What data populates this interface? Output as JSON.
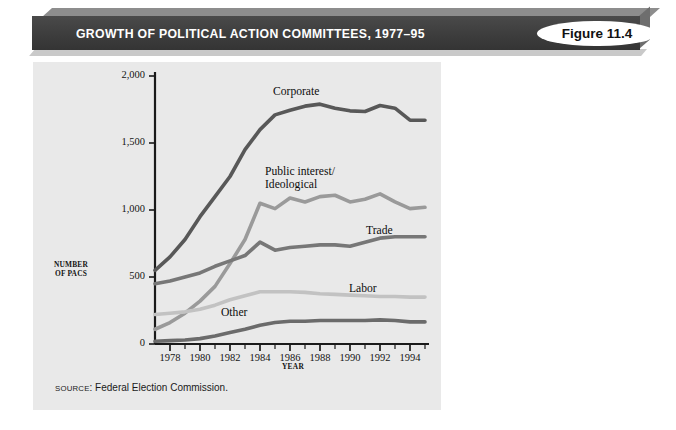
{
  "header": {
    "title": "GROWTH OF POLITICAL ACTION COMMITTEES, 1977–95",
    "badge": "Figure 11.4"
  },
  "source": {
    "prefix": "SOURCE",
    "text": ": Federal Election Commission."
  },
  "axes": {
    "y_title_line1": "NUMBER",
    "y_title_line2": "OF PACS",
    "x_title": "YEAR",
    "y_ticks": [
      "0",
      "500",
      "1,000",
      "1,500",
      "2,000"
    ],
    "x_ticks": [
      "1978",
      "1980",
      "1982",
      "1984",
      "1986",
      "1988",
      "1990",
      "1992",
      "1994"
    ]
  },
  "labels": {
    "corporate": "Corporate",
    "public_interest_line1": "Public interest/",
    "public_interest_line2": "Ideological",
    "trade": "Trade",
    "labor": "Labor",
    "other": "Other"
  },
  "colors": {
    "panel_background": "#e9e9e9",
    "title_bar": "#3f3f3f",
    "badge_background": "#ffffff",
    "axis": "#1a1a1a",
    "corporate": "#585858",
    "public_interest": "#9a9a9a",
    "trade": "#777777",
    "labor": "#c2c2c2",
    "other": "#6b6b6b"
  },
  "chart_data": {
    "type": "line",
    "title": "GROWTH OF POLITICAL ACTION COMMITTEES, 1977–95",
    "xlabel": "YEAR",
    "ylabel": "NUMBER OF PACS",
    "xlim": [
      1977,
      1995
    ],
    "ylim": [
      0,
      2000
    ],
    "ytick_values": [
      0,
      500,
      1000,
      1500,
      2000
    ],
    "xtick_values": [
      1978,
      1980,
      1982,
      1984,
      1986,
      1988,
      1990,
      1992,
      1994
    ],
    "minor_ticks": true,
    "grid": false,
    "legend": "inline-labels",
    "x": [
      1977,
      1978,
      1979,
      1980,
      1981,
      1982,
      1983,
      1984,
      1985,
      1986,
      1987,
      1988,
      1989,
      1990,
      1991,
      1992,
      1993,
      1994,
      1995
    ],
    "series": [
      {
        "name": "Corporate",
        "color": "#585858",
        "values": [
          550,
          650,
          780,
          950,
          1100,
          1250,
          1450,
          1600,
          1710,
          1745,
          1775,
          1790,
          1760,
          1740,
          1735,
          1780,
          1760,
          1670,
          1670
        ]
      },
      {
        "name": "Public interest/Ideological",
        "color": "#9a9a9a",
        "values": [
          110,
          160,
          230,
          320,
          430,
          600,
          780,
          1050,
          1010,
          1090,
          1060,
          1100,
          1110,
          1060,
          1080,
          1120,
          1060,
          1010,
          1020
        ]
      },
      {
        "name": "Trade",
        "color": "#777777",
        "values": [
          450,
          470,
          500,
          530,
          580,
          620,
          660,
          760,
          700,
          720,
          730,
          740,
          740,
          730,
          760,
          790,
          800,
          800,
          800
        ]
      },
      {
        "name": "Labor",
        "color": "#c2c2c2",
        "values": [
          220,
          230,
          240,
          260,
          290,
          330,
          360,
          390,
          390,
          390,
          385,
          375,
          370,
          365,
          360,
          355,
          355,
          350,
          350
        ]
      },
      {
        "name": "Other",
        "color": "#6b6b6b",
        "values": [
          20,
          25,
          30,
          40,
          60,
          85,
          110,
          140,
          160,
          170,
          170,
          175,
          175,
          175,
          175,
          180,
          175,
          165,
          165
        ]
      }
    ]
  }
}
